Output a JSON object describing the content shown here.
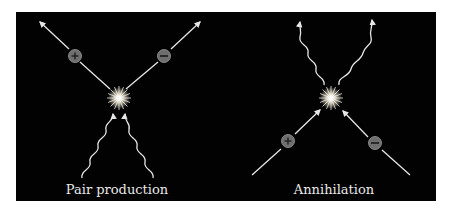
{
  "figure": {
    "background": "#020202",
    "diagrams": [
      {
        "id": "pair-production",
        "label": "Pair production",
        "particles": [
          {
            "charge": "+",
            "symbol": "+"
          },
          {
            "charge": "-",
            "symbol": "−"
          }
        ],
        "photons": 2
      },
      {
        "id": "annihilation",
        "label": "Annihilation",
        "particles": [
          {
            "charge": "+",
            "symbol": "+"
          },
          {
            "charge": "-",
            "symbol": "−"
          }
        ],
        "photons": 2
      }
    ],
    "colors": {
      "line": "#e6e6e6",
      "particle_fill": "#6e6e6e",
      "particle_stroke": "#9a9a9a",
      "flash": "#ffffff"
    }
  }
}
